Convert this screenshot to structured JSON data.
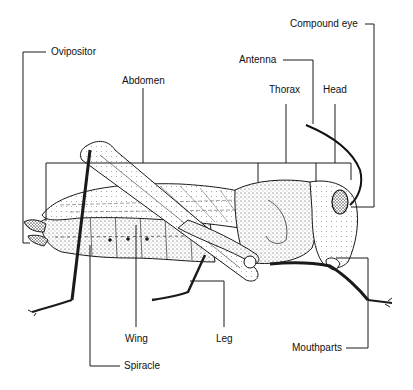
{
  "diagram": {
    "line_color": "#1a1a1a",
    "labels": [
      {
        "id": "ovipositor",
        "text": "Ovipositor"
      },
      {
        "id": "abdomen",
        "text": "Abdomen"
      },
      {
        "id": "antenna",
        "text": "Antenna"
      },
      {
        "id": "compound_eye",
        "text": "Compound eye"
      },
      {
        "id": "thorax",
        "text": "Thorax"
      },
      {
        "id": "head",
        "text": "Head"
      },
      {
        "id": "wing",
        "text": "Wing"
      },
      {
        "id": "leg",
        "text": "Leg"
      },
      {
        "id": "spiracle",
        "text": "Spiracle"
      },
      {
        "id": "mouthparts",
        "text": "Mouthparts"
      }
    ]
  }
}
